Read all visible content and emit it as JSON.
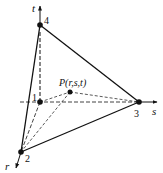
{
  "diagram": {
    "type": "tetrahedron-natural-coordinates",
    "axes": {
      "t": {
        "label": "t"
      },
      "s": {
        "label": "s"
      },
      "r": {
        "label": "r"
      }
    },
    "vertices": [
      {
        "id": "1",
        "label": "1"
      },
      {
        "id": "2",
        "label": "2"
      },
      {
        "id": "3",
        "label": "3"
      },
      {
        "id": "4",
        "label": "4"
      }
    ],
    "point": {
      "label": "P(r,s,t)"
    },
    "colors": {
      "line": "#111111",
      "background": "#ffffff"
    }
  }
}
